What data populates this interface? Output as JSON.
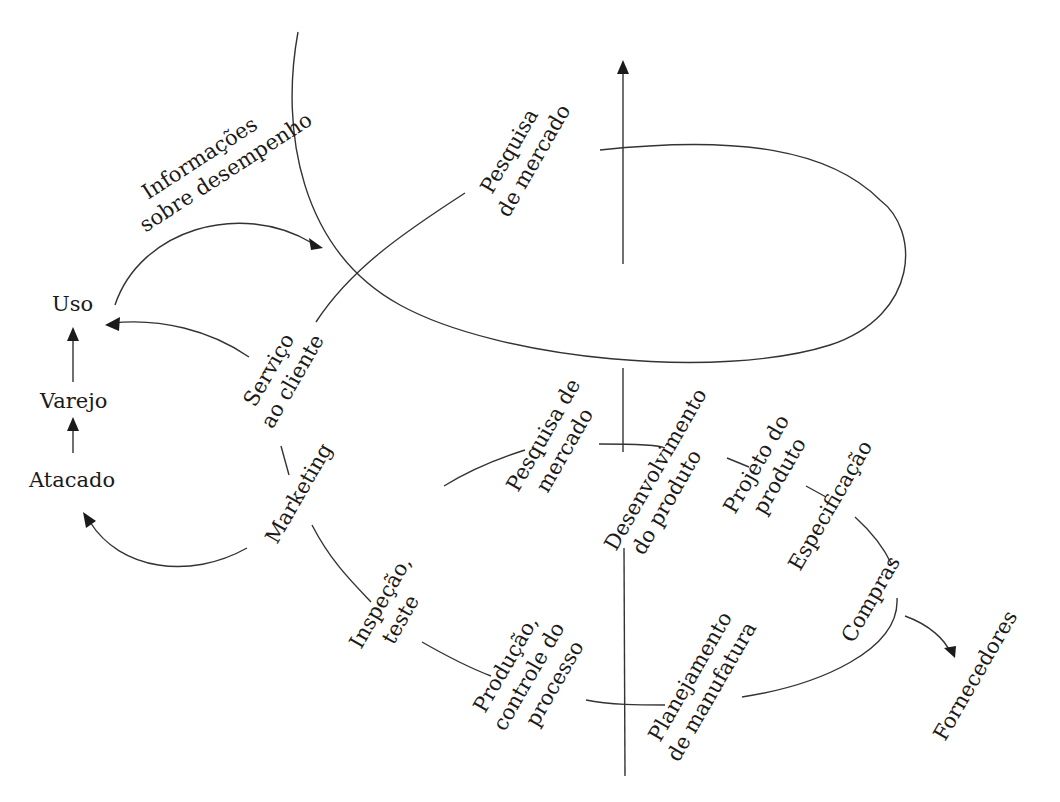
{
  "diagram": {
    "type": "product life cycle spiral",
    "colors": {
      "ink": "#1a1a1a",
      "line": "#333333",
      "background": "#ffffff"
    },
    "labels": {
      "informacoes_1": "Informações",
      "informacoes_2": "sobre desempenho",
      "uso": "Uso",
      "varejo": "Varejo",
      "atacado": "Atacado",
      "servico_1": "Serviço",
      "servico_2": "ao cliente",
      "marketing": "Marketing",
      "pesquisa_top_1": "Pesquisa",
      "pesquisa_top_2": "de mercado",
      "pesquisa_mid_1": "Pesquisa de",
      "pesquisa_mid_2": "mercado",
      "desenvolvimento_1": "Desenvolvimento",
      "desenvolvimento_2": "do produto",
      "projeto_1": "Projeto do",
      "projeto_2": "produto",
      "especificacao": "Especificação",
      "compras": "Compras",
      "fornecedores": "Fornecedores",
      "inspecao_1": "Inspeção,",
      "inspecao_2": "teste",
      "producao_1": "Produção,",
      "producao_2": "controle do",
      "producao_3": "processo",
      "planejamento_1": "Planejamento",
      "planejamento_2": "de manufatura"
    },
    "flows": [
      {
        "from": "Atacado",
        "to": "Varejo"
      },
      {
        "from": "Varejo",
        "to": "Uso"
      },
      {
        "from": "Serviço ao cliente",
        "to": "Uso"
      },
      {
        "from": "Marketing",
        "to": "Atacado"
      },
      {
        "from": "Uso",
        "to": "Informações sobre desempenho"
      },
      {
        "from": "Compras",
        "to": "Fornecedores"
      }
    ]
  }
}
